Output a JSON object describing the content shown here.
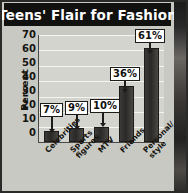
{
  "title": "Teens' Flair for Fashion",
  "chart_data": {
    "type": "bar",
    "title": "Teens' Flair for Fashion",
    "xlabel": "",
    "ylabel": "Percent",
    "ylim": [
      0,
      70
    ],
    "ytick_labels": [
      "70",
      "60",
      "50",
      "40",
      "30",
      "20",
      "10",
      "0"
    ],
    "ytick_values": [
      70,
      60,
      50,
      40,
      30,
      20,
      10,
      0
    ],
    "grid": true,
    "legend": "none",
    "categories": [
      "Celebrities",
      "Sports figures",
      "MTV",
      "Friends",
      "Personal/ style"
    ],
    "category_lines": [
      [
        "Celebrities"
      ],
      [
        "Sports",
        "figures"
      ],
      [
        "MTV"
      ],
      [
        "Friends"
      ],
      [
        "Personal/",
        "style"
      ]
    ],
    "values": [
      7,
      9,
      10,
      36,
      61
    ],
    "data_labels": [
      "7%",
      "9%",
      "10%",
      "36%",
      "61%"
    ],
    "colors": {
      "bar": "#2a2927",
      "plot_background": "#d4d4cf",
      "panel_background": "#c9c9c4",
      "title_banner": "#111110",
      "title_text": "#ffffff",
      "gridline": "#f4f4f1",
      "axis": "#4a4945",
      "callout_background": "#ffffff",
      "callout_border": "#1d1c1b"
    }
  }
}
